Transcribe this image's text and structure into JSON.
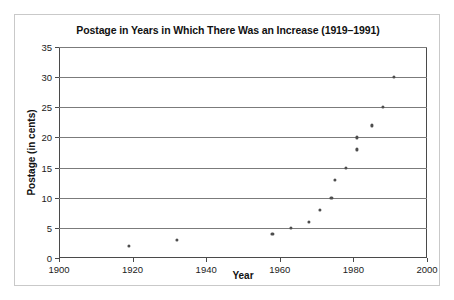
{
  "chart_data": {
    "type": "scatter",
    "title": "Postage in Years in Which There Was an Increase (1919–1991)",
    "xlabel": "Year",
    "ylabel": "Postage (in cents)",
    "xlim": [
      1900,
      2000
    ],
    "ylim": [
      0,
      35
    ],
    "xticks": [
      1900,
      1920,
      1940,
      1960,
      1980,
      2000
    ],
    "yticks": [
      0,
      5,
      10,
      15,
      20,
      25,
      30,
      35
    ],
    "grid": "horizontal",
    "legend": "none",
    "marker": "small filled circle",
    "marker_color": "#4d4d4d",
    "points": [
      {
        "x": 1919,
        "y": 2
      },
      {
        "x": 1932,
        "y": 3
      },
      {
        "x": 1958,
        "y": 4
      },
      {
        "x": 1963,
        "y": 5
      },
      {
        "x": 1968,
        "y": 6
      },
      {
        "x": 1971,
        "y": 8
      },
      {
        "x": 1974,
        "y": 10
      },
      {
        "x": 1975,
        "y": 13
      },
      {
        "x": 1978,
        "y": 15
      },
      {
        "x": 1981,
        "y": 18
      },
      {
        "x": 1981,
        "y": 20
      },
      {
        "x": 1985,
        "y": 22
      },
      {
        "x": 1988,
        "y": 25
      },
      {
        "x": 1991,
        "y": 30
      }
    ]
  }
}
